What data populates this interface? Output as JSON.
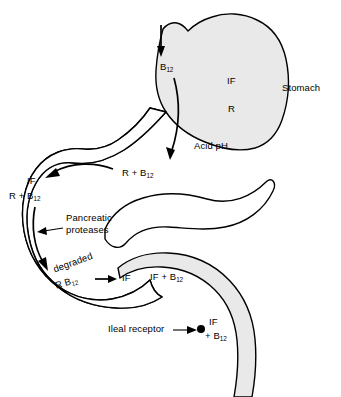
{
  "figure": {
    "type": "anatomical-flow-diagram",
    "background_color": "#ffffff",
    "organ_fill_color": "#e9e9e9",
    "outline_color": "#000000"
  },
  "labels": {
    "b12_entry": "B",
    "b12_entry_sub": "12",
    "intrinsic_factor_stomach": "IF",
    "r_protein_stomach": "R",
    "acid_ph": "Acid pH",
    "stomach": "Stomach",
    "r_plus_b12_stomach": "R + B",
    "r_plus_b12_stomach_sub": "12",
    "if_duodenum": "IF",
    "r_plus_b12_duodenum": "R + B",
    "r_plus_b12_duodenum_sub": "12",
    "pancreatic_proteases_line1": "Pancreatic",
    "pancreatic_proteases_line2": "proteases",
    "degraded": "degraded",
    "degraded_r_b12": "R B",
    "degraded_r_b12_sub": "12",
    "if_released": "IF",
    "if_plus_b12_jejunum": "IF + B",
    "if_plus_b12_jejunum_sub": "12",
    "ileal_receptor": "Ileal receptor",
    "if_ileum": "IF",
    "plus_b12_ileum": "+ B",
    "plus_b12_ileum_sub": "12"
  },
  "organs": [
    {
      "name": "stomach",
      "fill": "#e9e9e9"
    },
    {
      "name": "duodenum",
      "fill": "#e9e9e9"
    },
    {
      "name": "pancreas",
      "fill": "#ffffff"
    },
    {
      "name": "ileum",
      "fill": "#e9e9e9"
    }
  ],
  "arrows": [
    {
      "name": "esophageal-entry-arrow",
      "direction": "down"
    },
    {
      "name": "b12-descent-arrow",
      "direction": "down-curved"
    },
    {
      "name": "duodenum-transit-arrow",
      "direction": "left-curved"
    },
    {
      "name": "pancreatic-protease-arrow",
      "direction": "down-curved"
    },
    {
      "name": "degradation-to-if-arrow",
      "direction": "right"
    },
    {
      "name": "ileal-receptor-leader-arrow",
      "direction": "right"
    },
    {
      "name": "pancreatic-proteases-leader-arrow",
      "direction": "left"
    }
  ]
}
